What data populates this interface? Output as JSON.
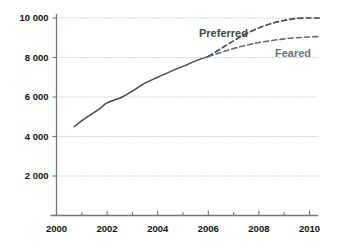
{
  "chart_data": {
    "type": "line",
    "title": "",
    "xlabel": "",
    "ylabel": "",
    "xlim": [
      2000,
      2010.4
    ],
    "ylim": [
      0,
      10600
    ],
    "grid": true,
    "legend_position": "inline-labels",
    "x_ticks": [
      "2000",
      "2002",
      "2004",
      "2006",
      "2008",
      "2010"
    ],
    "x_tick_values": [
      2000,
      2002,
      2004,
      2006,
      2008,
      2010
    ],
    "x_minor_tick_values": [
      2001,
      2003,
      2005,
      2007,
      2009
    ],
    "y_ticks": [
      "2 000",
      "4 000",
      "6 000",
      "8 000",
      "10 000"
    ],
    "y_tick_values": [
      2000,
      4000,
      6000,
      8000,
      10000
    ],
    "series": [
      {
        "name": "Historical",
        "style": "solid",
        "color": "#3f4a4e",
        "label_shown": false,
        "x": [
          2000.7,
          2001.0,
          2001.4,
          2001.7,
          2002.0,
          2002.6,
          2003.0,
          2003.5,
          2004.0,
          2004.6,
          2005.0,
          2005.5,
          2006.0
        ],
        "values": [
          4500,
          4800,
          5150,
          5400,
          5700,
          6000,
          6300,
          6700,
          7000,
          7350,
          7550,
          7830,
          8050
        ]
      },
      {
        "name": "Preferred",
        "style": "dashed",
        "color": "#3f4a4e",
        "label_shown": true,
        "label": "Preferred",
        "label_color": "#3d4a4d",
        "x": [
          2006.0,
          2006.5,
          2007.0,
          2007.5,
          2008.0,
          2008.5,
          2009.0,
          2009.5,
          2010.0,
          2010.4
        ],
        "values": [
          8050,
          8450,
          8850,
          9200,
          9500,
          9720,
          9880,
          9980,
          10000,
          10000
        ]
      },
      {
        "name": "Feared",
        "style": "dashed",
        "color": "#5c6b70",
        "label_shown": true,
        "label": "Feared",
        "label_color": "#67767b",
        "x": [
          2006.0,
          2006.5,
          2007.0,
          2007.5,
          2008.0,
          2008.5,
          2009.0,
          2009.5,
          2010.0,
          2010.4
        ],
        "values": [
          8050,
          8260,
          8460,
          8620,
          8760,
          8860,
          8940,
          9000,
          9040,
          9060
        ]
      }
    ],
    "annotations": [
      {
        "text": "Preferred",
        "x_px": 199,
        "y_px": 37,
        "color": "#3d4a4d"
      },
      {
        "text": "Feared",
        "x_px": 275,
        "y_px": 57,
        "color": "#67767b"
      }
    ],
    "colors": {
      "grid": "#9aa3a6",
      "axis": "#6f7779",
      "text": "#111111",
      "preferred": "#3f4a4e",
      "feared": "#67767b",
      "background": "#ffffff"
    }
  }
}
